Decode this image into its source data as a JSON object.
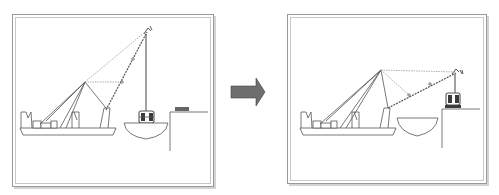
{
  "diagram": {
    "type": "crane-lift-sequence",
    "panels": [
      {
        "id": "before",
        "description": "Crane barge with boom raised; load suspended above transport vessel",
        "pier_label": "",
        "elements": [
          "crane-barge",
          "crane-boom",
          "hoist-line",
          "load-module",
          "transport-vessel",
          "quay-pier"
        ]
      },
      {
        "id": "after",
        "description": "Crane boom lowered; load placed on quay pier",
        "pier_label": "",
        "elements": [
          "crane-barge",
          "crane-boom",
          "hoist-line",
          "load-module",
          "transport-vessel",
          "quay-pier"
        ]
      }
    ],
    "transition_arrow": {
      "direction": "right",
      "color": "#6e6e6e"
    },
    "colors": {
      "line": "#555555",
      "dashed_line": "#9a9a9a",
      "frame": "#9a9a9a",
      "load_fill": "#3a3a3a"
    }
  }
}
